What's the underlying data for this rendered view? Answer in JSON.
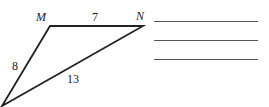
{
  "diagram": {
    "type": "triangle",
    "vertices": [
      {
        "id": "M",
        "label": "M"
      },
      {
        "id": "N",
        "label": "N"
      },
      {
        "id": "P",
        "label": ""
      }
    ],
    "sides": [
      {
        "between": [
          "M",
          "N"
        ],
        "length": "7"
      },
      {
        "between": [
          "M",
          "P"
        ],
        "length": "8"
      },
      {
        "between": [
          "N",
          "P"
        ],
        "length": "13"
      }
    ]
  },
  "answer_lines": {
    "count": 3
  }
}
